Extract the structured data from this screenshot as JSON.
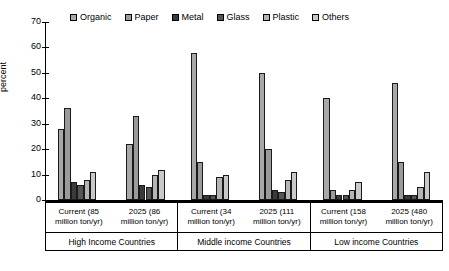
{
  "chart_data": {
    "type": "bar",
    "title": "",
    "xlabel": "",
    "ylabel": "percent",
    "ylim": [
      0,
      70
    ],
    "ytick_step": 10,
    "yticks": [
      70,
      60,
      50,
      40,
      30,
      20,
      10,
      0
    ],
    "grid": false,
    "legend_position": "top",
    "legend": [
      "Organic",
      "Paper",
      "Metal",
      "Glass",
      "Plastic",
      "Others"
    ],
    "series_colors": {
      "Organic": "#a8a8a8",
      "Paper": "#9a9a9a",
      "Metal": "#3a3a3a",
      "Glass": "#555555",
      "Plastic": "#b5b5b5",
      "Others": "#c9c9c9"
    },
    "categories": [
      "Current (85 million ton/yr)",
      "2025 (86 million ton/yr)",
      "Current (34 million ton/yr)",
      "2025 (111 million ton/yr)",
      "Current (158 million ton/yr)",
      "2025 (480 million ton/yr)"
    ],
    "series": [
      {
        "name": "Organic",
        "values": [
          28,
          22,
          58,
          50,
          40,
          46
        ]
      },
      {
        "name": "Paper",
        "values": [
          36,
          33,
          15,
          20,
          4,
          15
        ]
      },
      {
        "name": "Metal",
        "values": [
          7,
          6,
          2,
          4,
          2,
          2
        ]
      },
      {
        "name": "Glass",
        "values": [
          6,
          5,
          2,
          3,
          2,
          2
        ]
      },
      {
        "name": "Plastic",
        "values": [
          8,
          10,
          9,
          8,
          4,
          5
        ]
      },
      {
        "name": "Others",
        "values": [
          11,
          12,
          10,
          11,
          7,
          11
        ]
      }
    ]
  },
  "groups": [
    {
      "band_label": "High Income Countries",
      "subgroups": [
        {
          "line1": "Current (85",
          "line2": "million ton/yr)"
        },
        {
          "line1": "2025 (86",
          "line2": "million ton/yr)"
        }
      ]
    },
    {
      "band_label": "Middle income Countries",
      "subgroups": [
        {
          "line1": "Current (34",
          "line2": "million ton/yr)"
        },
        {
          "line1": "2025 (111",
          "line2": "million ton/yr)"
        }
      ]
    },
    {
      "band_label": "Low income Countries",
      "subgroups": [
        {
          "line1": "Current (158",
          "line2": "million ton/yr)"
        },
        {
          "line1": "2025 (480",
          "line2": "million ton/yr)"
        }
      ]
    }
  ]
}
